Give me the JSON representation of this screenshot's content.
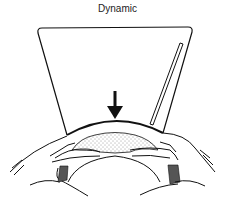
{
  "figure": {
    "title": "Dynamic",
    "colors": {
      "ink": "#111111",
      "background": "#ffffff",
      "stipple": "#333333"
    },
    "elements": {
      "arrow_direction": "down",
      "rod_side": "right"
    }
  }
}
